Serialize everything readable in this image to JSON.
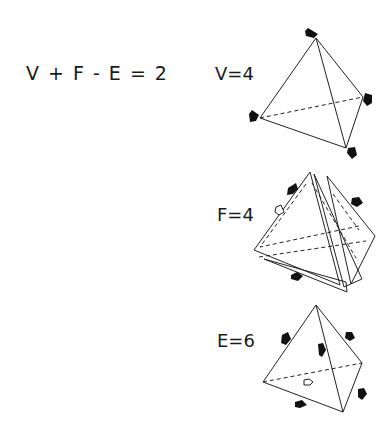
{
  "diagram": {
    "formula": "V + F - E = 2",
    "panels": [
      {
        "id": "vertices",
        "label": "V=4",
        "description": "Tetrahedron with arrows pointing to each of its 4 vertices"
      },
      {
        "id": "faces",
        "label": "F=4",
        "description": "Exploded tetrahedron showing its 4 separate faces"
      },
      {
        "id": "edges",
        "label": "E=6",
        "description": "Tetrahedron with arrows pointing to each of its 6 edges"
      }
    ],
    "colors": {
      "background": "#ffffff",
      "ink": "#1a1a1a"
    }
  }
}
